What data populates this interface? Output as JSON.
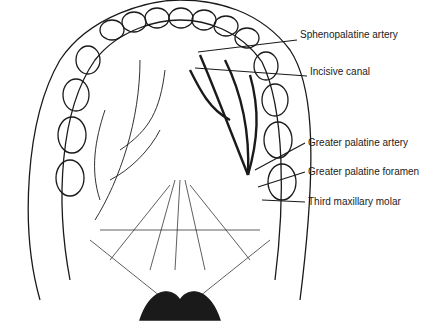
{
  "diagram": {
    "labels": [
      {
        "id": "sphenopalatine-artery",
        "text": "Sphenopalatine artery",
        "x": 300,
        "y": 35
      },
      {
        "id": "incisive-canal",
        "text": "Incisive canal",
        "x": 310,
        "y": 72
      },
      {
        "id": "greater-palatine-artery",
        "text": "Greater palatine artery",
        "x": 308,
        "y": 139
      },
      {
        "id": "greater-palatine-foramen",
        "text": "Greater palatine foramen",
        "x": 308,
        "y": 168
      },
      {
        "id": "third-maxillary-molar",
        "text": "Third maxillary molar",
        "x": 308,
        "y": 198
      }
    ],
    "colors": {
      "ink": "#1a1a1a",
      "paper": "#ffffff"
    }
  }
}
